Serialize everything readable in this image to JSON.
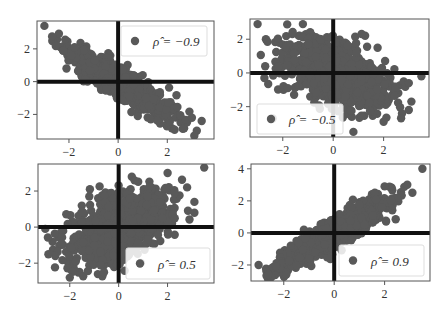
{
  "chart_data": [
    {
      "type": "scatter",
      "panel": "top-left",
      "title": "",
      "xlabel": "",
      "ylabel": "",
      "xlim": [
        -3.3,
        3.9
      ],
      "ylim": [
        -3.5,
        3.7
      ],
      "xticks": [
        -2,
        0,
        2
      ],
      "yticks": [
        -2,
        0,
        2
      ],
      "xtick_labels": [
        "−2",
        "0",
        "2"
      ],
      "ytick_labels": [
        "−2",
        "0",
        "2"
      ],
      "grid": false,
      "reference_lines": {
        "x": 0,
        "y": 0
      },
      "legend": {
        "label": "ρ̂ = −0.9",
        "placement": "top-right"
      },
      "correlation": -0.9,
      "n_points": 1000,
      "seed": 11,
      "notable_points": [
        [
          -3.0,
          3.4
        ],
        [
          3.4,
          -2.4
        ],
        [
          3.0,
          -2.2
        ],
        [
          3.2,
          -3.0
        ],
        [
          3.1,
          -3.3
        ],
        [
          0.8,
          -2.1
        ],
        [
          -2.1,
          0.8
        ]
      ]
    },
    {
      "type": "scatter",
      "panel": "top-right",
      "title": "",
      "xlabel": "",
      "ylabel": "",
      "xlim": [
        -3.3,
        3.8
      ],
      "ylim": [
        -3.8,
        3.2
      ],
      "xticks": [
        -2,
        0,
        2
      ],
      "yticks": [
        -2,
        0,
        2
      ],
      "xtick_labels": [
        "−2",
        "0",
        "2"
      ],
      "ytick_labels": [
        "−2",
        "0",
        "2"
      ],
      "grid": false,
      "reference_lines": {
        "x": 0,
        "y": 0
      },
      "legend": {
        "label": "ρ̂ = −0.5",
        "placement": "bottom-left"
      },
      "correlation": -0.5,
      "n_points": 1000,
      "seed": 23,
      "notable_points": [
        [
          -3.0,
          2.9
        ],
        [
          -1.2,
          2.9
        ],
        [
          3.5,
          -0.2
        ],
        [
          3.0,
          -0.6
        ],
        [
          3.1,
          -1.7
        ],
        [
          3.0,
          -2.2
        ],
        [
          2.0,
          -2.9
        ],
        [
          0.8,
          -3.5
        ],
        [
          -1.8,
          -0.9
        ],
        [
          -2.4,
          -2.7
        ]
      ]
    },
    {
      "type": "scatter",
      "panel": "bottom-left",
      "title": "",
      "xlabel": "",
      "ylabel": "",
      "xlim": [
        -3.3,
        3.9
      ],
      "ylim": [
        -3.1,
        3.5
      ],
      "xticks": [
        -2,
        0,
        2
      ],
      "yticks": [
        -2,
        0,
        2
      ],
      "xtick_labels": [
        "−2",
        "0",
        "2"
      ],
      "ytick_labels": [
        "−2",
        "0",
        "2"
      ],
      "grid": false,
      "reference_lines": {
        "x": 0,
        "y": 0
      },
      "legend": {
        "label": "ρ̂ = 0.5",
        "placement": "bottom-right"
      },
      "correlation": 0.5,
      "n_points": 1000,
      "seed": 37,
      "notable_points": [
        [
          3.5,
          3.3
        ],
        [
          2.0,
          3.0
        ],
        [
          2.8,
          2.2
        ],
        [
          3.1,
          1.4
        ],
        [
          3.1,
          0.8
        ],
        [
          -3.0,
          -0.1
        ],
        [
          -2.0,
          -2.8
        ],
        [
          -1.2,
          1.7
        ]
      ]
    },
    {
      "type": "scatter",
      "panel": "bottom-right",
      "title": "",
      "xlabel": "",
      "ylabel": "",
      "xlim": [
        -3.3,
        3.8
      ],
      "ylim": [
        -3.0,
        4.3
      ],
      "xticks": [
        -2,
        0,
        2
      ],
      "yticks": [
        -2,
        0,
        2,
        4
      ],
      "xtick_labels": [
        "−2",
        "0",
        "2"
      ],
      "ytick_labels": [
        "−2",
        "0",
        "2",
        "4"
      ],
      "grid": false,
      "reference_lines": {
        "x": 0,
        "y": 0
      },
      "legend": {
        "label": "ρ̂ = 0.9",
        "placement": "bottom-right"
      },
      "correlation": 0.9,
      "n_points": 1000,
      "seed": 53,
      "notable_points": [
        [
          3.5,
          4.0
        ],
        [
          2.9,
          3.0
        ],
        [
          3.1,
          2.5
        ],
        [
          2.0,
          2.9
        ],
        [
          -3.0,
          -2.0
        ],
        [
          -2.6,
          -2.6
        ],
        [
          -1.9,
          -2.6
        ],
        [
          -1.2,
          0.2
        ]
      ]
    }
  ],
  "style": {
    "point_color": "#595959",
    "reference_line_color": "#111111",
    "frame_color": "#555555",
    "legend_border_color": "#dddddd"
  }
}
